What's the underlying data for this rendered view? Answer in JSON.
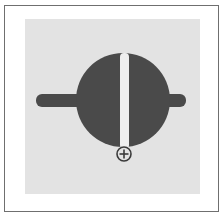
{
  "document": {
    "title": "Valve Symbol Diagram",
    "frame_color": "#6f6f6f",
    "page_background": "#ffffff",
    "panel_background": "#e3e3e3"
  },
  "diagram": {
    "name": "butterfly-valve-symbol",
    "colors": {
      "body": "#4a4a4a",
      "slot": "#eeeeee",
      "marker_stroke": "#3a3a3a",
      "panel": "#e3e3e3"
    },
    "shapes": {
      "disc": {
        "label": "valve-disc",
        "cx": 98,
        "cy": 81,
        "r": 47
      },
      "shaft_left": {
        "label": "shaft-left",
        "x": 11,
        "y": 75,
        "width": 95,
        "height": 13,
        "radius": 6
      },
      "shaft_right": {
        "label": "shaft-right",
        "x": 90,
        "y": 75,
        "width": 71,
        "height": 13,
        "radius": 6
      },
      "slot": {
        "label": "indicator-slot",
        "x": 95,
        "y": 34,
        "width": 9,
        "height": 96,
        "radius": 4
      },
      "marker": {
        "label": "crosshair-target",
        "cx": 99,
        "cy": 135,
        "r": 7,
        "stroke_width": 1.6,
        "cross_arm": 4.5
      }
    }
  }
}
